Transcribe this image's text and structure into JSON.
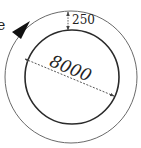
{
  "diagram": {
    "type": "ring-cross-section",
    "labels": {
      "partial_left": "e",
      "inner_diameter": "8000",
      "ring_thickness": "250"
    },
    "colors": {
      "background": "#ffffff",
      "inner_circle_stroke": "#2a2a2a",
      "outer_circle_stroke": "#6a6a6a",
      "dimension_line": "#444444",
      "arrow_fill": "#111111",
      "text": "#222222"
    },
    "shapes": {
      "outer_circle": {
        "cx": 71,
        "cy": 77,
        "r": 66
      },
      "inner_circle": {
        "cx": 72,
        "cy": 77,
        "r": 47
      }
    },
    "icons": {
      "direction_arrow": "filled-triangle-arrow"
    }
  }
}
